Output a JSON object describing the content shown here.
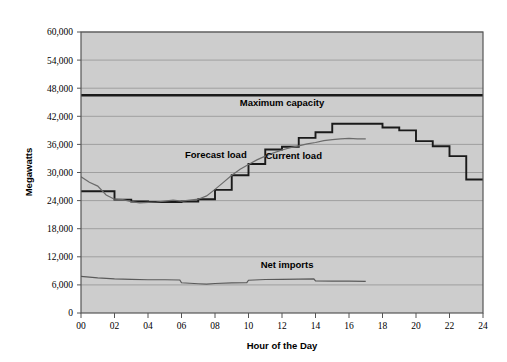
{
  "chart_data": {
    "type": "line",
    "title": "",
    "xlabel": "Hour of the Day",
    "ylabel": "Megawatts",
    "xlim": [
      0,
      24
    ],
    "ylim": [
      0,
      60000
    ],
    "grid": true,
    "legend": "inline-annotations",
    "xticks": [
      "00",
      "02",
      "04",
      "06",
      "08",
      "10",
      "12",
      "14",
      "16",
      "18",
      "20",
      "22",
      "24"
    ],
    "xtick_values": [
      0,
      2,
      4,
      6,
      8,
      10,
      12,
      14,
      16,
      18,
      20,
      22,
      24
    ],
    "yticks": [
      "0",
      "6,000",
      "12,000",
      "18,000",
      "24,000",
      "30,000",
      "36,000",
      "42,000",
      "48,000",
      "54,000",
      "60,000"
    ],
    "ytick_values": [
      0,
      6000,
      12000,
      18000,
      24000,
      30000,
      36000,
      42000,
      48000,
      54000,
      60000
    ],
    "series": [
      {
        "name": "Maximum capacity",
        "style": "thick-flat-line",
        "color": "#1a1a1a",
        "label_x": 12.0,
        "label_y": 44200,
        "x": [
          0,
          24
        ],
        "values": [
          46500,
          46500
        ]
      },
      {
        "name": "Forecast load",
        "style": "step",
        "color": "#1a1a1a",
        "label_x": 8.05,
        "label_y": 33100,
        "x": [
          0,
          1,
          2,
          3,
          4,
          5,
          6,
          7,
          8,
          9,
          10,
          11,
          12,
          13,
          14,
          15,
          16,
          17,
          18,
          19,
          20,
          21,
          22,
          23,
          24
        ],
        "values": [
          26000,
          26000,
          24200,
          23800,
          23700,
          23700,
          23800,
          24300,
          26300,
          29400,
          31800,
          34900,
          35500,
          37400,
          38600,
          40400,
          40400,
          40400,
          39600,
          39000,
          36700,
          35600,
          33500,
          28500,
          28500
        ]
      },
      {
        "name": "Current load",
        "style": "smooth",
        "color": "#6b6b6b",
        "label_x": 12.7,
        "label_y": 32900,
        "x": [
          0,
          0.5,
          1,
          1.5,
          2,
          2.5,
          3,
          3.5,
          4,
          4.5,
          5,
          5.5,
          6,
          6.5,
          7,
          7.5,
          8,
          8.5,
          9,
          9.5,
          10,
          10.5,
          11,
          11.5,
          12,
          12.5,
          13,
          13.5,
          14,
          14.5,
          15,
          15.5,
          16,
          16.5,
          17
        ],
        "values": [
          29100,
          27900,
          27100,
          25200,
          24300,
          24200,
          23800,
          23500,
          23600,
          23700,
          23900,
          24100,
          23900,
          24100,
          24300,
          25000,
          26400,
          27900,
          29400,
          30700,
          31700,
          32700,
          33500,
          34200,
          34800,
          35300,
          35700,
          36100,
          36400,
          36800,
          37000,
          37200,
          37300,
          37200,
          37200
        ]
      },
      {
        "name": "Net imports",
        "style": "smooth",
        "color": "#5a5a5a",
        "label_x": 12.3,
        "label_y": 9600,
        "x": [
          0,
          1,
          2,
          3,
          4,
          5,
          5.9,
          6,
          7,
          7.5,
          8,
          9,
          9.9,
          10,
          11,
          12,
          13,
          13.9,
          14,
          15,
          16,
          17
        ],
        "values": [
          7800,
          7500,
          7300,
          7200,
          7100,
          7100,
          7050,
          6450,
          6250,
          6150,
          6300,
          6450,
          6500,
          7000,
          7150,
          7200,
          7250,
          7300,
          6850,
          6800,
          6800,
          6750
        ]
      }
    ]
  },
  "figure": {
    "background": "#ffffff",
    "plot_background": "#cdcdcd",
    "gridline_color": "#9a9a9a",
    "frame_color": "#555555"
  }
}
